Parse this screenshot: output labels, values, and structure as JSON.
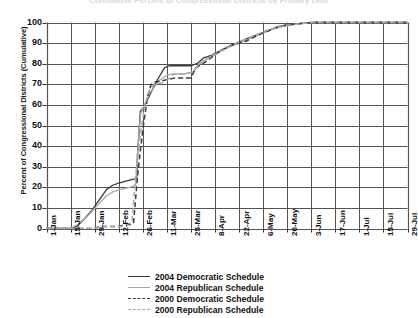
{
  "chart": {
    "title": "Cumulative Percent of Congressional Districts by Primary Date",
    "ylabel": "Percent of Congressional Districts (Cumulative)",
    "xlabel": ""
  },
  "legend": {
    "items": [
      {
        "label": "2004 Democratic Schedule",
        "color": "#3a3a3a",
        "style": "solid"
      },
      {
        "label": "2004 Republican Schedule",
        "color": "#a8a8a8",
        "style": "solid"
      },
      {
        "label": "2000 Democratic Schedule",
        "color": "#3a3a3a",
        "style": "dashed"
      },
      {
        "label": "2000 Republican Schedule",
        "color": "#a8a8a8",
        "style": "dashed"
      }
    ]
  },
  "chart_data": {
    "type": "line",
    "title": "Cumulative Percent of Congressional Districts by Primary Date",
    "xlabel": "",
    "ylabel": "Percent of Congressional Districts (Cumulative)",
    "ylim": [
      0,
      100
    ],
    "ytick_labels": [
      "0",
      "10",
      "20",
      "30",
      "40",
      "50",
      "60",
      "70",
      "80",
      "90",
      "100"
    ],
    "ytick_values": [
      0,
      10,
      20,
      30,
      40,
      50,
      60,
      70,
      80,
      90,
      100
    ],
    "x": [
      "1-Jan",
      "15-Jan",
      "29-Jan",
      "12-Feb",
      "26-Feb",
      "11-Mar",
      "25-Mar",
      "8-Apr",
      "22-Apr",
      "6-May",
      "20-May",
      "3-Jun",
      "17-Jun",
      "1-Jul",
      "15-Jul",
      "29-Jul"
    ],
    "xtick_labels": [
      "1-Jan",
      "15-Jan",
      "29-Jan",
      "12-Feb",
      "26-Feb",
      "11-Mar",
      "25-Mar",
      "8-Apr",
      "22-Apr",
      "6-May",
      "20-May",
      "3-Jun",
      "17-Jun",
      "1-Jul",
      "15-Jul",
      "29-Jul"
    ],
    "grid": true,
    "legend_position": "below",
    "series": [
      {
        "name": "2004 Democratic Schedule",
        "color": "#3a3a3a",
        "style": "solid",
        "points": [
          [
            0,
            0
          ],
          [
            1.0,
            0
          ],
          [
            1.25,
            1
          ],
          [
            1.6,
            5
          ],
          [
            1.9,
            9
          ],
          [
            2.2,
            14
          ],
          [
            2.5,
            19
          ],
          [
            2.75,
            21
          ],
          [
            3.0,
            22
          ],
          [
            3.3,
            23
          ],
          [
            3.62,
            24
          ],
          [
            3.75,
            24
          ],
          [
            3.78,
            36
          ],
          [
            3.85,
            48
          ],
          [
            3.9,
            57
          ],
          [
            4.05,
            59
          ],
          [
            4.55,
            71
          ],
          [
            4.9,
            78
          ],
          [
            5.1,
            79
          ],
          [
            5.6,
            79
          ],
          [
            6.0,
            79
          ],
          [
            6.25,
            80
          ],
          [
            6.55,
            83
          ],
          [
            6.85,
            84
          ],
          [
            7.0,
            85
          ],
          [
            7.5,
            88
          ],
          [
            7.9,
            90
          ],
          [
            8.5,
            93
          ],
          [
            9.0,
            95
          ],
          [
            9.6,
            98
          ],
          [
            10.0,
            99
          ],
          [
            11.0,
            100
          ],
          [
            15,
            100
          ]
        ]
      },
      {
        "name": "2004 Republican Schedule",
        "color": "#a8a8a8",
        "style": "solid",
        "points": [
          [
            0,
            0
          ],
          [
            1.0,
            0
          ],
          [
            1.3,
            2
          ],
          [
            1.7,
            6
          ],
          [
            2.1,
            11
          ],
          [
            2.5,
            16
          ],
          [
            2.8,
            18
          ],
          [
            3.1,
            19
          ],
          [
            3.45,
            20
          ],
          [
            3.7,
            21
          ],
          [
            3.78,
            35
          ],
          [
            3.85,
            48
          ],
          [
            3.92,
            56
          ],
          [
            4.3,
            66
          ],
          [
            4.7,
            72
          ],
          [
            4.95,
            74
          ],
          [
            5.2,
            75
          ],
          [
            5.7,
            75
          ],
          [
            6.1,
            76
          ],
          [
            6.35,
            80
          ],
          [
            6.6,
            82
          ],
          [
            6.9,
            84
          ],
          [
            7.3,
            87
          ],
          [
            7.8,
            89
          ],
          [
            8.4,
            92
          ],
          [
            9.0,
            95
          ],
          [
            9.6,
            98
          ],
          [
            10.1,
            99
          ],
          [
            11.0,
            100
          ],
          [
            15,
            100
          ]
        ]
      },
      {
        "name": "2000 Democratic Schedule",
        "color": "#3a3a3a",
        "style": "dashed",
        "points": [
          [
            0,
            0
          ],
          [
            2.0,
            0
          ],
          [
            2.2,
            1
          ],
          [
            3.0,
            1
          ],
          [
            3.3,
            2
          ],
          [
            3.55,
            2
          ],
          [
            3.62,
            3
          ],
          [
            3.7,
            14
          ],
          [
            3.78,
            25
          ],
          [
            3.9,
            38
          ],
          [
            4.05,
            52
          ],
          [
            4.2,
            64
          ],
          [
            4.35,
            70
          ],
          [
            4.5,
            71
          ],
          [
            4.9,
            72
          ],
          [
            5.3,
            73
          ],
          [
            5.7,
            73
          ],
          [
            6.0,
            73
          ],
          [
            6.2,
            78
          ],
          [
            6.5,
            80
          ],
          [
            6.85,
            83
          ],
          [
            7.2,
            86
          ],
          [
            7.7,
            89
          ],
          [
            8.3,
            91
          ],
          [
            9.0,
            95
          ],
          [
            9.7,
            98
          ],
          [
            10.2,
            99
          ],
          [
            11.0,
            100
          ],
          [
            15,
            100
          ]
        ]
      },
      {
        "name": "2000 Republican Schedule",
        "color": "#a8a8a8",
        "style": "dashed",
        "points": [
          [
            0,
            0
          ],
          [
            2.0,
            0
          ],
          [
            2.3,
            1
          ],
          [
            3.1,
            1
          ],
          [
            3.35,
            2
          ],
          [
            3.55,
            3
          ],
          [
            3.6,
            10
          ],
          [
            3.68,
            22
          ],
          [
            3.8,
            36
          ],
          [
            3.95,
            50
          ],
          [
            4.1,
            60
          ],
          [
            4.3,
            68
          ],
          [
            4.5,
            70
          ],
          [
            4.9,
            71
          ],
          [
            5.3,
            75
          ],
          [
            5.8,
            75
          ],
          [
            6.05,
            76
          ],
          [
            6.3,
            79
          ],
          [
            6.6,
            82
          ],
          [
            6.95,
            84
          ],
          [
            7.4,
            87
          ],
          [
            7.9,
            90
          ],
          [
            8.5,
            93
          ],
          [
            9.1,
            96
          ],
          [
            9.8,
            98
          ],
          [
            10.3,
            99
          ],
          [
            11.0,
            100
          ],
          [
            15,
            100
          ]
        ]
      }
    ]
  }
}
